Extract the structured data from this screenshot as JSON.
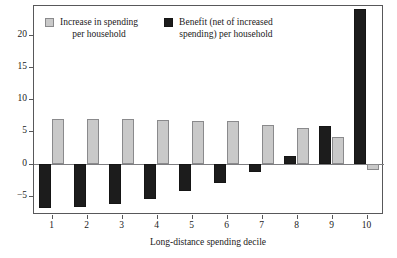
{
  "chart_data": {
    "type": "bar",
    "title": "",
    "xlabel": "Long-distance spending decile",
    "ylabel": "",
    "categories": [
      "1",
      "2",
      "3",
      "4",
      "5",
      "6",
      "7",
      "8",
      "9",
      "10"
    ],
    "ylim": [
      -8,
      24.5
    ],
    "yticks": [
      20,
      15,
      10,
      5,
      0,
      -5
    ],
    "ytick_labels": [
      "20",
      "15",
      "10",
      "5",
      "0",
      "−5"
    ],
    "grid": false,
    "legend_position": "top-left-inside",
    "series": [
      {
        "name": "Benefit (net of increased spending) per household",
        "color": "#1c1c1c",
        "values": [
          -6.9,
          -6.8,
          -6.3,
          -5.5,
          -4.3,
          -3.0,
          -1.3,
          1.1,
          5.8,
          24.0
        ]
      },
      {
        "name": "Increase in spending per household",
        "color": "#c9c9c9",
        "values": [
          6.9,
          7.0,
          6.9,
          6.8,
          6.6,
          6.6,
          6.0,
          5.5,
          4.1,
          -1.0
        ]
      }
    ]
  },
  "legend": {
    "entries": [
      {
        "swatch": "gray",
        "line1": "Increase in spending",
        "line2": "per household"
      },
      {
        "swatch": "black",
        "line1": "Benefit (net of increased",
        "line2": "spending) per household"
      }
    ]
  },
  "axis": {
    "x_title": "Long-distance spending decile"
  },
  "colors": {
    "gray_bar": "#c9c9c9",
    "gray_bar_border": "#8a8a8c",
    "black_bar": "#1c1c1c",
    "frame": "#58585a",
    "zero_line": "#7d7d80",
    "background": "#ffffff"
  }
}
